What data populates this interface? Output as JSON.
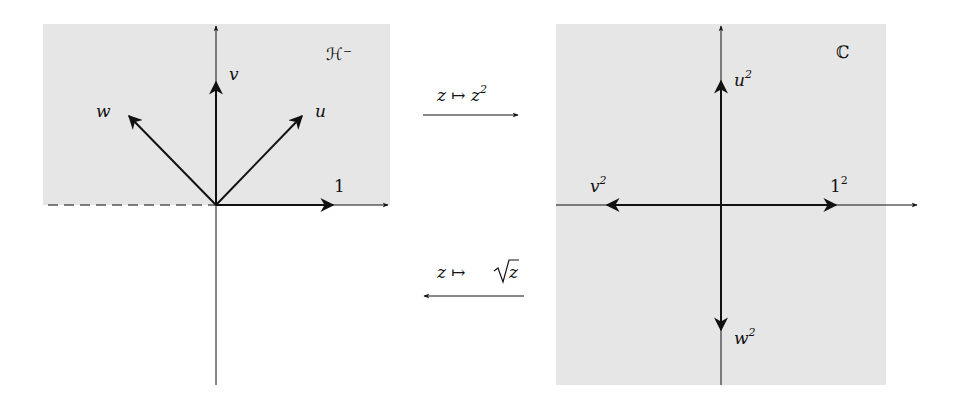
{
  "diagram": {
    "left_plane": {
      "region_label": "ℋ⁻",
      "vectors": [
        {
          "name": "u",
          "label": "u"
        },
        {
          "name": "v",
          "label": "v"
        },
        {
          "name": "w",
          "label": "w"
        },
        {
          "name": "one",
          "label": "1"
        }
      ]
    },
    "right_plane": {
      "region_label": "ℂ",
      "vectors": [
        {
          "name": "u-squared",
          "label": "u",
          "sup": "2"
        },
        {
          "name": "v-squared",
          "label": "v",
          "sup": "2"
        },
        {
          "name": "w-squared",
          "label": "w",
          "sup": "2"
        },
        {
          "name": "one-squared",
          "label": "1",
          "sup": "2"
        }
      ]
    },
    "maps": {
      "forward": {
        "label": "z ↦ z",
        "sup": "2"
      },
      "inverse": {
        "label_prefix": "z ↦ ",
        "sqrt_arg": "z"
      }
    },
    "colors": {
      "shade": "#e6e6e6",
      "ink": "#111111",
      "dashed": "#555555"
    }
  }
}
